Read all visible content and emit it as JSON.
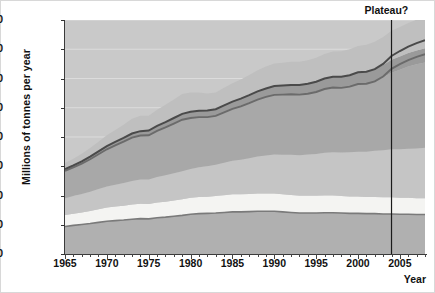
{
  "chart_data": {
    "type": "area",
    "title": "",
    "xlabel": "Year",
    "ylabel": "Millions of tonnes per year",
    "xlim": [
      1965,
      2008
    ],
    "ylim": [
      0,
      4000
    ],
    "ytick_values": [
      0,
      500,
      1000,
      1500,
      2000,
      2500,
      3000,
      3500,
      4000
    ],
    "ytick_labels": [
      "0",
      "500",
      "1000",
      "1500",
      "2000",
      "2500",
      "3000",
      "3500",
      "4000"
    ],
    "xtick_labels": [
      "1965",
      "1970",
      "1975",
      "1980",
      "1985",
      "1990",
      "1995",
      "2000",
      "2005"
    ],
    "xtick_values": [
      1965,
      1970,
      1975,
      1980,
      1985,
      1990,
      1995,
      2000,
      2005
    ],
    "minor_tick_interval": 1,
    "grid": true,
    "legend": "none",
    "stacked": true,
    "annotations": [
      {
        "text": "Plateau?",
        "x": 2004,
        "y": 4000,
        "line": true
      }
    ],
    "x": [
      1965,
      1966,
      1967,
      1968,
      1969,
      1970,
      1971,
      1972,
      1973,
      1974,
      1975,
      1976,
      1977,
      1978,
      1979,
      1980,
      1981,
      1982,
      1983,
      1984,
      1985,
      1986,
      1987,
      1988,
      1989,
      1990,
      1991,
      1992,
      1993,
      1994,
      1995,
      1996,
      1997,
      1998,
      1999,
      2000,
      2001,
      2002,
      2003,
      2004,
      2005,
      2006,
      2007,
      2008
    ],
    "series": [
      {
        "name": "band-1-bottom",
        "color": "#b0b0b0",
        "values": [
          470,
          490,
          505,
          520,
          540,
          560,
          570,
          580,
          595,
          605,
          600,
          620,
          630,
          645,
          660,
          680,
          690,
          695,
          700,
          710,
          720,
          720,
          725,
          730,
          730,
          730,
          720,
          710,
          700,
          700,
          700,
          705,
          705,
          700,
          695,
          695,
          690,
          690,
          685,
          685,
          680,
          680,
          675,
          675
        ]
      },
      {
        "name": "band-2",
        "color": "#f4f4f2",
        "values": [
          195,
          200,
          205,
          215,
          225,
          235,
          240,
          245,
          250,
          255,
          255,
          260,
          265,
          270,
          275,
          280,
          285,
          285,
          290,
          295,
          300,
          300,
          300,
          305,
          305,
          305,
          300,
          300,
          295,
          295,
          295,
          295,
          295,
          290,
          290,
          290,
          285,
          285,
          285,
          285,
          280,
          280,
          280,
          280
        ]
      },
      {
        "name": "band-3",
        "color": "#c5c5c5",
        "values": [
          290,
          300,
          315,
          330,
          345,
          360,
          375,
          390,
          405,
          415,
          420,
          435,
          450,
          465,
          480,
          495,
          510,
          520,
          535,
          555,
          575,
          590,
          610,
          630,
          650,
          665,
          675,
          685,
          695,
          705,
          715,
          730,
          740,
          745,
          755,
          765,
          775,
          790,
          805,
          820,
          830,
          840,
          850,
          860
        ]
      },
      {
        "name": "band-4",
        "color": "#a8a8a8",
        "values": [
          465,
          490,
          520,
          555,
          595,
          635,
          670,
          705,
          740,
          750,
          755,
          790,
          820,
          850,
          880,
          870,
          855,
          840,
          835,
          860,
          885,
          915,
          945,
          975,
          1000,
          1020,
          1030,
          1035,
          1035,
          1040,
          1060,
          1090,
          1105,
          1105,
          1120,
          1150,
          1160,
          1185,
          1240,
          1310,
          1360,
          1405,
          1440,
          1460
        ]
      },
      {
        "name": "band-5",
        "color": "#9a9a9a",
        "values": [
          30,
          35,
          40,
          45,
          50,
          55,
          60,
          65,
          70,
          75,
          80,
          85,
          90,
          95,
          100,
          105,
          110,
          115,
          115,
          120,
          125,
          130,
          135,
          140,
          145,
          150,
          155,
          160,
          165,
          170,
          175,
          180,
          185,
          190,
          195,
          200,
          205,
          210,
          215,
          220,
          225,
          230,
          235,
          240
        ]
      },
      {
        "name": "band-6-top",
        "color": "#bfbfbf",
        "values": [
          105,
          115,
          130,
          145,
          165,
          185,
          205,
          225,
          250,
          265,
          255,
          275,
          295,
          315,
          340,
          330,
          310,
          290,
          285,
          300,
          315,
          330,
          345,
          360,
          375,
          385,
          390,
          395,
          395,
          400,
          410,
          420,
          430,
          435,
          445,
          455,
          460,
          470,
          480,
          495,
          505,
          515,
          525,
          530
        ]
      }
    ],
    "total_line": {
      "name": "total-outline",
      "color": "#4a4a4a",
      "values": [
        1450,
        1515,
        1585,
        1665,
        1755,
        1845,
        1915,
        1985,
        2060,
        2100,
        2110,
        2190,
        2255,
        2325,
        2395,
        2430,
        2450,
        2455,
        2475,
        2540,
        2605,
        2655,
        2715,
        2780,
        2830,
        2870,
        2880,
        2890,
        2890,
        2910,
        2945,
        3000,
        3030,
        3030,
        3055,
        3105,
        3115,
        3160,
        3250,
        3385,
        3470,
        3545,
        3605,
        3655
      ]
    },
    "mid_line": {
      "name": "oil-top-line",
      "color": "#6b6b6b",
      "values": [
        1420,
        1480,
        1545,
        1620,
        1705,
        1790,
        1855,
        1920,
        1990,
        2025,
        2030,
        2105,
        2165,
        2230,
        2295,
        2325,
        2340,
        2340,
        2360,
        2420,
        2480,
        2525,
        2580,
        2640,
        2685,
        2720,
        2725,
        2730,
        2725,
        2740,
        2770,
        2820,
        2845,
        2840,
        2860,
        2905,
        2910,
        2950,
        3035,
        3165,
        3245,
        3315,
        3370,
        3415
      ]
    },
    "lower_line": {
      "name": "coal-top-line",
      "color": "#7a7a7a",
      "values": [
        470,
        490,
        505,
        520,
        540,
        560,
        570,
        580,
        595,
        605,
        600,
        620,
        630,
        645,
        660,
        680,
        690,
        695,
        700,
        710,
        720,
        720,
        725,
        730,
        730,
        730,
        720,
        710,
        700,
        700,
        700,
        705,
        705,
        700,
        695,
        695,
        690,
        690,
        685,
        685,
        680,
        680,
        675,
        675
      ]
    }
  }
}
